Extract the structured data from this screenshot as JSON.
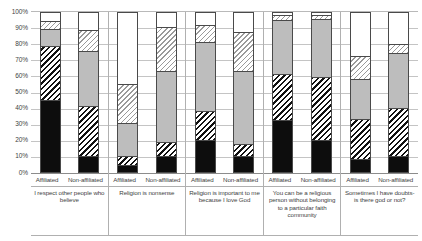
{
  "chart_data": {
    "type": "bar",
    "title": "",
    "subtitle": "",
    "xlabel": "",
    "ylabel": "",
    "stacked": true,
    "normalized_100pct": true,
    "grid": true,
    "legend_position": "none",
    "ylim": [
      0,
      100
    ],
    "ytick_labels": [
      "100%",
      "90%",
      "80%",
      "70%",
      "60%",
      "50%",
      "40%",
      "30%",
      "20%",
      "10%",
      "0%"
    ],
    "ytick_values": [
      100,
      90,
      80,
      70,
      60,
      50,
      40,
      30,
      20,
      10,
      0
    ],
    "series_names": [
      "Strongly agree",
      "Agree",
      "Neutral",
      "Disagree",
      "Strongly disagree"
    ],
    "series_fills": [
      "black",
      "black-diagonal-hatch",
      "gray",
      "light-diagonal-hatch",
      "white"
    ],
    "series_colors": [
      "#0d0d0d",
      "#ffffff",
      "#bdbdbd",
      "#ffffff",
      "#ffffff"
    ],
    "categories": [
      "Affiliated",
      "Non-affiliated",
      "Affiliated",
      "Non-affiliated",
      "Affiliated",
      "Non-affiliated",
      "Affiliated",
      "Non-affiliated",
      "Affiliated",
      "Non-affiliated"
    ],
    "groups": [
      {
        "question": "I respect other people who believe",
        "bars": [
          {
            "label": "Affiliated",
            "values": [
              46,
              34,
              10,
              5,
              5
            ]
          },
          {
            "label": "Non-affiliated",
            "values": [
              10,
              31,
              35,
              13,
              11
            ]
          }
        ]
      },
      {
        "question": "Religion is nonsense",
        "bars": [
          {
            "label": "Affiliated",
            "values": [
              4,
              5,
              21,
              24,
              46
            ]
          },
          {
            "label": "Non-affiliated",
            "values": [
              10,
              8,
              45,
              28,
              9
            ]
          }
        ]
      },
      {
        "question": "Religion is important to me because I love God",
        "bars": [
          {
            "label": "Affiliated",
            "values": [
              20,
              18,
              44,
              10,
              8
            ]
          },
          {
            "label": "Non-affiliated",
            "values": [
              10,
              7,
              46,
              25,
              12
            ]
          }
        ]
      },
      {
        "question": "You can be a religious person without belonging to a particular faith community",
        "bars": [
          {
            "label": "Affiliated",
            "values": [
              33,
              29,
              34,
              3,
              1
            ]
          },
          {
            "label": "Non-affiliated",
            "values": [
              20,
              40,
              37,
              2,
              1
            ]
          }
        ]
      },
      {
        "question": "Sometimes I have doubts- is there god or not?",
        "bars": [
          {
            "label": "Affiliated",
            "values": [
              8,
              25,
              25,
              14,
              28
            ]
          },
          {
            "label": "Non-affiliated",
            "values": [
              10,
              30,
              35,
              5,
              20
            ]
          }
        ]
      }
    ]
  }
}
